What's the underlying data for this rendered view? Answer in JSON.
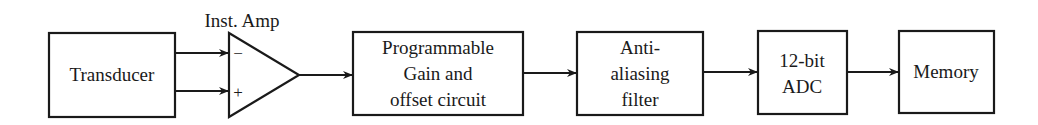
{
  "diagram": {
    "title_label": "Inst. Amp",
    "colors": {
      "stroke": "#1a1a1a",
      "background": "#ffffff"
    },
    "blocks": [
      {
        "id": "transducer",
        "lines": [
          "Transducer"
        ]
      },
      {
        "id": "pga",
        "lines": [
          "Programmable",
          "Gain and",
          "offset circuit"
        ]
      },
      {
        "id": "aaf",
        "lines": [
          "Anti-",
          "aliasing",
          "filter"
        ]
      },
      {
        "id": "adc",
        "lines": [
          "12-bit",
          "ADC"
        ]
      },
      {
        "id": "memory",
        "lines": [
          "Memory"
        ]
      }
    ],
    "amplifier": {
      "label": "Inst. Amp",
      "inverting_symbol": "−",
      "noninverting_symbol": "+"
    }
  }
}
